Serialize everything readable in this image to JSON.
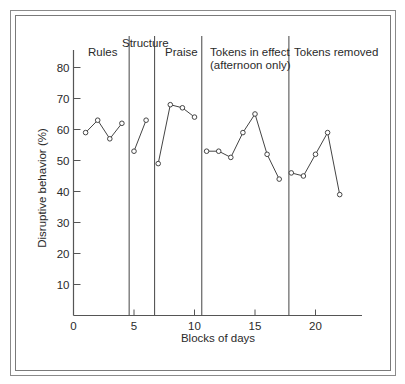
{
  "chart_data": {
    "type": "line",
    "title": "",
    "xlabel": "Blocks of days",
    "ylabel": "Disruptive behavior (%)",
    "xlim": [
      0,
      24
    ],
    "ylim": [
      0,
      85
    ],
    "x_ticks": [
      0,
      5,
      10,
      15,
      20
    ],
    "y_ticks": [
      10,
      20,
      30,
      40,
      50,
      60,
      70,
      80
    ],
    "grid": false,
    "legend": null,
    "phases": [
      {
        "label": "Rules",
        "label_line2": "",
        "start": 0.5,
        "end": 4.6
      },
      {
        "label": "Structure",
        "label_line2": "",
        "start": 4.6,
        "end": 6.7
      },
      {
        "label": "Praise",
        "label_line2": "",
        "start": 6.7,
        "end": 10.6
      },
      {
        "label": "Tokens in effect",
        "label_line2": "(afternoon only)",
        "start": 10.6,
        "end": 17.8
      },
      {
        "label": "Tokens removed",
        "label_line2": "",
        "start": 17.8,
        "end": 23
      }
    ],
    "phase_change_lines": [
      4.6,
      6.7,
      10.6,
      17.8
    ],
    "series": [
      {
        "name": "Rules",
        "x": [
          1,
          2,
          3,
          4
        ],
        "values": [
          59,
          63,
          57,
          62
        ]
      },
      {
        "name": "Structure",
        "x": [
          5,
          6
        ],
        "values": [
          53,
          63
        ]
      },
      {
        "name": "Praise",
        "x": [
          7,
          8,
          9,
          10
        ],
        "values": [
          49,
          68,
          67,
          64
        ]
      },
      {
        "name": "Tokens in effect (afternoon only)",
        "x": [
          11,
          12,
          13,
          14,
          15,
          16,
          17
        ],
        "values": [
          53,
          53,
          51,
          59,
          65,
          52,
          44
        ]
      },
      {
        "name": "Tokens removed",
        "x": [
          18,
          19,
          20,
          21,
          22
        ],
        "values": [
          46,
          45,
          52,
          59,
          39
        ]
      }
    ]
  }
}
